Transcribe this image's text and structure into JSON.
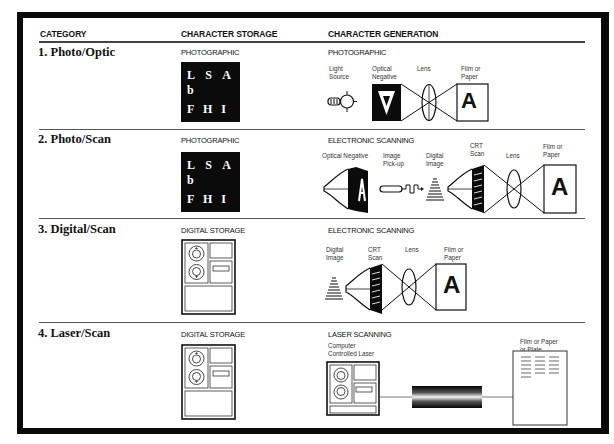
{
  "headers": {
    "category": "CATEGORY",
    "storage": "CHARACTER STORAGE",
    "generation": "CHARACTER GENERATION"
  },
  "rows": [
    {
      "category": "1. Photo/Optic",
      "storage_type": "PHOTOGRAPHIC",
      "storage_chars": [
        "L S A b",
        "F H I v"
      ],
      "generation_type": "PHOTOGRAPHIC",
      "labels": {
        "light_source": [
          "Light",
          "Source"
        ],
        "optical_negative": [
          "Optical",
          "Negative"
        ],
        "lens": "Lens",
        "film": [
          "Film or",
          "Paper"
        ],
        "negative_glyph": "A",
        "output_glyph": "A"
      }
    },
    {
      "category": "2. Photo/Scan",
      "storage_type": "PHOTOGRAPHIC",
      "storage_chars": [
        "L S A b",
        "F H I v"
      ],
      "generation_type": "ELECTRONIC SCANNING",
      "labels": {
        "optical_negative": "Optical Negative",
        "image_pickup": [
          "Image",
          "Pick-up"
        ],
        "digital_image": [
          "Digital",
          "Image"
        ],
        "crt_scan": [
          "CRT",
          "Scan"
        ],
        "lens": "Lens",
        "film": [
          "Film or",
          "Paper"
        ],
        "output_glyph": "A"
      }
    },
    {
      "category": "3. Digital/Scan",
      "storage_type": "DIGITAL STORAGE",
      "generation_type": "ELECTRONIC SCANNING",
      "labels": {
        "digital_image": [
          "Digital",
          "Image"
        ],
        "crt_scan": [
          "CRT",
          "Scan"
        ],
        "lens": "Lens",
        "film": [
          "Film or",
          "Paper"
        ],
        "output_glyph": "A"
      }
    },
    {
      "category": "4. Laser/Scan",
      "storage_type": "DIGITAL STORAGE",
      "generation_type": "LASER SCANNING",
      "labels": {
        "computer_laser": [
          "Computer",
          "Controlled Laser"
        ],
        "film": [
          "Film or Paper",
          "or Plate"
        ]
      }
    }
  ]
}
